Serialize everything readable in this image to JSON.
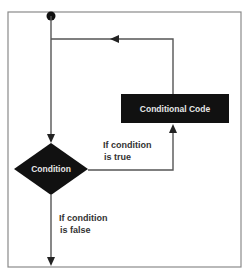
{
  "diagram": {
    "type": "flowchart",
    "title": "",
    "nodes": {
      "start": {
        "kind": "start-dot",
        "label": ""
      },
      "condition": {
        "kind": "decision",
        "label": "Condition"
      },
      "conditional_code": {
        "kind": "process",
        "label": "Conditional Code"
      }
    },
    "edges": {
      "true_branch": {
        "from": "condition",
        "to": "conditional_code",
        "label_line1": "If condition",
        "label_line2": "is true"
      },
      "false_branch": {
        "from": "condition",
        "to": "end",
        "label_line1": "If condition",
        "label_line2": "is false"
      },
      "loop_back": {
        "from": "conditional_code",
        "to": "condition",
        "label_line1": "",
        "label_line2": ""
      }
    },
    "colors": {
      "node_fill": "#111111",
      "node_text": "#e6e6e6",
      "line": "#555555",
      "frame": "#8a8a8a",
      "label_text": "#333333"
    }
  }
}
